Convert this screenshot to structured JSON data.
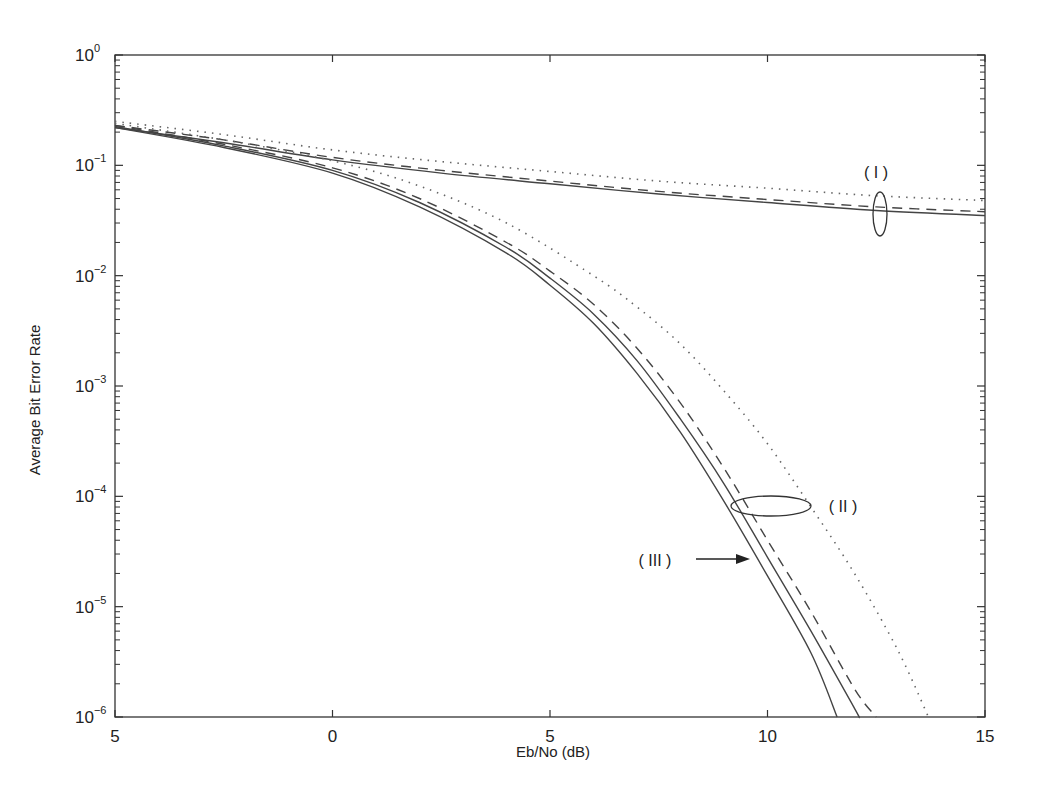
{
  "chart_data": {
    "type": "line",
    "title": "",
    "xlabel": "Eb/No (dB)",
    "ylabel": "Average Bit Error Rate",
    "xlim": [
      -5,
      15
    ],
    "ylim": [
      1e-06,
      1
    ],
    "yscale": "log",
    "grid": false,
    "legend": null,
    "x_ticks": [
      {
        "value": -5,
        "label": "5"
      },
      {
        "value": 0,
        "label": "0"
      },
      {
        "value": 5,
        "label": "5"
      },
      {
        "value": 10,
        "label": "10"
      },
      {
        "value": 15,
        "label": "15"
      }
    ],
    "y_ticks": [
      {
        "value": 1,
        "base": "10",
        "exp": "0"
      },
      {
        "value": 0.1,
        "base": "10",
        "exp": "−1"
      },
      {
        "value": 0.01,
        "base": "10",
        "exp": "−2"
      },
      {
        "value": 0.001,
        "base": "10",
        "exp": "−3"
      },
      {
        "value": 0.0001,
        "base": "10",
        "exp": "−4"
      },
      {
        "value": 1e-05,
        "base": "10",
        "exp": "−5"
      },
      {
        "value": 1e-06,
        "base": "10",
        "exp": "−6"
      }
    ],
    "series": [
      {
        "name": "Group I solid",
        "group": "I",
        "style": "solid",
        "x": [
          -5,
          -2.5,
          0,
          2.5,
          5,
          7.5,
          10,
          12.5,
          15
        ],
        "y": [
          0.22,
          0.16,
          0.112,
          0.085,
          0.068,
          0.055,
          0.046,
          0.039,
          0.035
        ]
      },
      {
        "name": "Group I dashed",
        "group": "I",
        "style": "dashed",
        "x": [
          -5,
          -2.5,
          0,
          2.5,
          5,
          7.5,
          10,
          12.5,
          15
        ],
        "y": [
          0.23,
          0.17,
          0.118,
          0.09,
          0.072,
          0.058,
          0.049,
          0.042,
          0.038
        ]
      },
      {
        "name": "Group I dotted",
        "group": "I",
        "style": "dotted",
        "x": [
          -5,
          -2.5,
          0,
          2.5,
          5,
          7.5,
          10,
          12.5,
          15
        ],
        "y": [
          0.25,
          0.19,
          0.138,
          0.108,
          0.088,
          0.072,
          0.062,
          0.053,
          0.048
        ]
      },
      {
        "name": "Group II dotted",
        "group": "II",
        "style": "dotted",
        "x": [
          -5,
          -2.5,
          0,
          2,
          4,
          6,
          7,
          8,
          9,
          10,
          11,
          12,
          13,
          13.7
        ],
        "y": [
          0.24,
          0.17,
          0.11,
          0.065,
          0.03,
          0.01,
          0.0052,
          0.0024,
          0.0009,
          0.0003,
          8e-05,
          2e-05,
          4e-06,
          1e-06
        ]
      },
      {
        "name": "Group II dashed",
        "group": "II",
        "style": "dashed",
        "x": [
          -5,
          -2.5,
          0,
          2,
          4,
          5,
          6,
          7,
          8,
          9,
          10,
          11,
          12,
          12.5
        ],
        "y": [
          0.23,
          0.155,
          0.095,
          0.05,
          0.02,
          0.011,
          0.0055,
          0.0022,
          0.0007,
          0.00018,
          4e-05,
          9e-06,
          1.8e-06,
          1e-06
        ]
      },
      {
        "name": "Group II solid",
        "group": "II",
        "style": "solid",
        "x": [
          -5,
          -2.5,
          0,
          2,
          4,
          5,
          6,
          7,
          8,
          9,
          10,
          11,
          12,
          12.1
        ],
        "y": [
          0.225,
          0.15,
          0.09,
          0.046,
          0.018,
          0.0095,
          0.0045,
          0.0017,
          0.0005,
          0.00013,
          2.8e-05,
          6e-06,
          1.2e-06,
          1e-06
        ]
      },
      {
        "name": "Curve III solid",
        "group": "III",
        "style": "solid",
        "x": [
          -5,
          -2.5,
          0,
          2,
          4,
          5,
          6,
          7,
          8,
          9,
          10,
          11,
          11.6
        ],
        "y": [
          0.22,
          0.145,
          0.085,
          0.042,
          0.016,
          0.0082,
          0.0037,
          0.0013,
          0.00038,
          9e-05,
          1.9e-05,
          3.8e-06,
          1e-06
        ]
      }
    ],
    "annotations": [
      {
        "label": "( I )",
        "type": "ellipse",
        "target_x": 12.5,
        "target_y": 0.037
      },
      {
        "label": "( II )",
        "type": "ellipse",
        "target_x": 10,
        "target_y": 0.0001
      },
      {
        "label": "( III )",
        "type": "arrow",
        "target_x": 9.5,
        "target_y": 2.3e-05
      }
    ]
  },
  "labels": {
    "xlabel": "Eb/No (dB)",
    "ylabel": "Average Bit Error Rate",
    "annot_I": "( I )",
    "annot_II": "( II )",
    "annot_III": "( III )"
  }
}
